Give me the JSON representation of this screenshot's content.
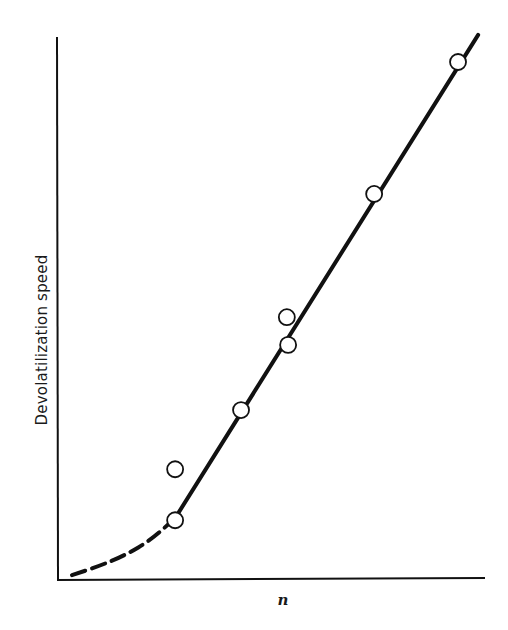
{
  "chart_data": {
    "type": "scatter",
    "title": "",
    "xlabel": "n",
    "ylabel": "Devolatilization speed",
    "xlim": [
      0,
      100
    ],
    "ylim": [
      0,
      100
    ],
    "grid": false,
    "legend": null,
    "ticks": {
      "x": [],
      "y": []
    },
    "series": [
      {
        "name": "measured points",
        "marker": "open-circle",
        "points": [
          {
            "x": 27.6,
            "y": 11.0
          },
          {
            "x": 27.6,
            "y": 20.4
          },
          {
            "x": 43.0,
            "y": 31.3
          },
          {
            "x": 54.0,
            "y": 43.3
          },
          {
            "x": 53.7,
            "y": 48.4
          },
          {
            "x": 74.1,
            "y": 71.1
          },
          {
            "x": 93.7,
            "y": 95.4
          }
        ]
      },
      {
        "name": "fit (linear region)",
        "style": "solid",
        "points": [
          {
            "x": 27.6,
            "y": 11.4
          },
          {
            "x": 98.4,
            "y": 100.4
          }
        ]
      },
      {
        "name": "fit (extrapolated low-n region)",
        "style": "dashed",
        "points": [
          {
            "x": 3.5,
            "y": 0.9
          },
          {
            "x": 10.0,
            "y": 2.6
          },
          {
            "x": 16.0,
            "y": 4.6
          },
          {
            "x": 22.0,
            "y": 7.4
          },
          {
            "x": 27.6,
            "y": 11.4
          }
        ]
      }
    ]
  },
  "layout": {
    "plot": {
      "left": 57,
      "right": 485,
      "top": 37,
      "bottom": 580
    },
    "colors": {
      "ink": "#111111",
      "background": "#ffffff"
    }
  }
}
